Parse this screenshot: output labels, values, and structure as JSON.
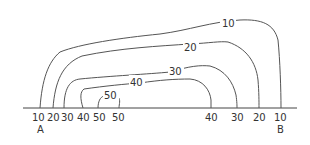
{
  "diagram": {
    "type": "topographic-contour-map",
    "baseline": {
      "label_start": "A",
      "label_end": "B"
    },
    "contours": [
      {
        "value": "10",
        "label": "10"
      },
      {
        "value": "20",
        "label": "20"
      },
      {
        "value": "30",
        "label": "30"
      },
      {
        "value": "40",
        "label": "40"
      },
      {
        "value": "50",
        "label": "50"
      }
    ],
    "baseline_labels_left": [
      "10",
      "20",
      "30",
      "40",
      "50",
      "50"
    ],
    "baseline_labels_right": [
      "40",
      "30",
      "20",
      "10"
    ],
    "point_a": "A",
    "point_b": "B"
  }
}
